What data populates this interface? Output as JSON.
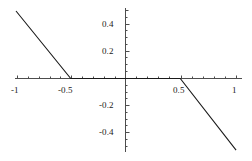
{
  "figure": {
    "width": 252,
    "height": 161,
    "background": "#ffffff",
    "axis_color": "#4d4d4d",
    "curve_color": "#1a1a1a"
  },
  "chart_data": {
    "type": "line",
    "title": "",
    "subtitle": "",
    "xlabel": "",
    "ylabel": "",
    "xlim": [
      -1.0,
      1.07
    ],
    "ylim": [
      -0.55,
      0.52
    ],
    "grid": false,
    "legend": null,
    "annotations": [],
    "axes_style": "centered-cross",
    "x_ticks_major": [
      -1,
      -0.5,
      0.5,
      1
    ],
    "x_tick_labels": [
      "-1",
      "-0.5",
      "0.5",
      "1"
    ],
    "y_ticks_major": [
      0.4,
      0.2,
      -0.2,
      -0.4
    ],
    "y_tick_labels": [
      "0.4",
      "0.2",
      "-0.2",
      "-0.4"
    ],
    "x_minor_step": 0.1,
    "y_minor_step": 0.05,
    "series": [
      {
        "name": "f(x) = min(0, 0.5 - |x|) for x<0 reflected",
        "x": [
          -1.0,
          -0.5,
          0.5,
          1.01
        ],
        "values": [
          0.5,
          0.0,
          0.0,
          -0.53
        ],
        "color": "#1a1a1a",
        "linewidth": 1.1
      }
    ]
  },
  "labels": {
    "x": [
      {
        "text": "-1",
        "left": 11,
        "top": 86
      },
      {
        "text": "-0.5",
        "left": 58,
        "top": 86
      },
      {
        "text": "0.5",
        "left": 173,
        "top": 86
      },
      {
        "text": "1",
        "left": 232,
        "top": 86
      }
    ],
    "y": [
      {
        "text": "0.4",
        "left": 102,
        "top": 20
      },
      {
        "text": "0.2",
        "left": 102,
        "top": 47
      },
      {
        "text": "-0.2",
        "left": 99,
        "top": 101
      },
      {
        "text": "-0.4",
        "left": 99,
        "top": 128
      }
    ]
  }
}
